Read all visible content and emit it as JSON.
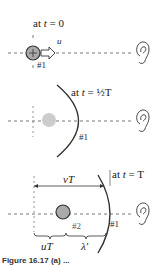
{
  "panel1": {
    "time_label_prefix": "at ",
    "time_var": "t",
    "time_value": " = 0",
    "velocity_label": "u",
    "wave_label": "#1"
  },
  "panel2": {
    "time_label_prefix": "at ",
    "time_var": "t",
    "time_value": " = ½T",
    "wave_label": "#1"
  },
  "panel3": {
    "time_label_prefix": "at ",
    "time_var": "t",
    "time_value": " = T",
    "distance_label": "vT",
    "source_distance_label": "uT",
    "wavelength_label": "λ′",
    "wave1_label": "#1",
    "wave2_label": "#2"
  },
  "caption": "Figure 16.17 (a) ..."
}
